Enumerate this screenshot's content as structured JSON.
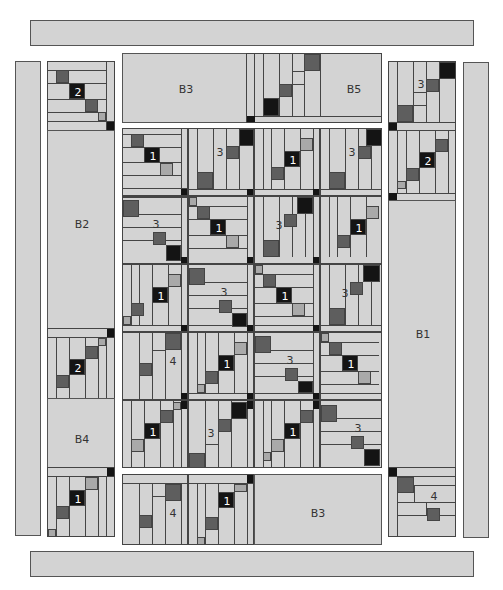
{
  "diagram": {
    "colors": {
      "background": "#ffffff",
      "fabric_light": "#d3d3d3",
      "fabric_medium": "#a9a9a9",
      "fabric_dark": "#5e5e5e",
      "fabric_black": "#141414",
      "seam": "#444444"
    },
    "borders": {
      "top": {
        "label": ""
      },
      "bottom": {
        "label": ""
      },
      "left_outer": {
        "label": ""
      },
      "right_outer": {
        "label": ""
      },
      "b1": {
        "label": "B1"
      },
      "b2": {
        "label": "B2"
      },
      "b3_top": {
        "label": "B3"
      },
      "b3_bottom": {
        "label": "B3"
      },
      "b4": {
        "label": "B4"
      },
      "b5": {
        "label": "B5"
      }
    },
    "block_numbers": {
      "one": "1",
      "two": "2",
      "three": "3",
      "four": "4"
    },
    "center_grid": {
      "columns": 4,
      "rows": 6,
      "blocks": [
        [
          "1",
          "3",
          "1",
          "3"
        ],
        [
          "3",
          "1",
          "3",
          "1"
        ],
        [
          "1",
          "3",
          "1",
          "3"
        ],
        [
          "4",
          "1",
          "3",
          "1"
        ],
        [
          "1",
          "3",
          "1",
          "3"
        ]
      ]
    },
    "side_blocks": {
      "left_top": "2",
      "left_mid": "2",
      "left_bottom": "1",
      "right_top": "3",
      "right_second": "2",
      "right_bottom": "4",
      "bottom_left_a": "4",
      "bottom_left_b": "1"
    }
  }
}
